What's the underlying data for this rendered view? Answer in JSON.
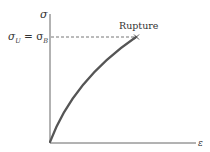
{
  "diagram": {
    "type": "stress-strain curve (brittle material)",
    "y_axis_label": "σ",
    "x_axis_label": "ε",
    "level_label_left": "σ",
    "level_label_sub1": "U",
    "level_label_eq": " = σ",
    "level_label_sub2": "B",
    "rupture_label": "Rupture",
    "rupture_marker": "×",
    "colors": {
      "axis": "#555555",
      "curve": "#555555",
      "dashed": "#666666",
      "text": "#333333"
    }
  }
}
